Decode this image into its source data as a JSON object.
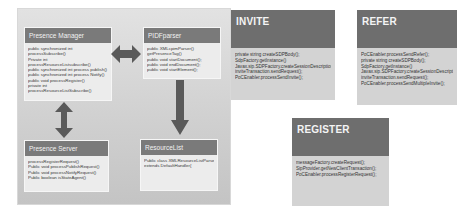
{
  "diagram": {
    "left_panel": {
      "presence_manager": {
        "title": "Presence Manager",
        "lines": [
          "public synchronized int",
          "processSubscribe()",
          "Private int",
          "processResourceListsubscribe()",
          "public synchronized int process publish()",
          "public synchronized int process Notify()",
          "public void processRegister()",
          "private int",
          "processResourceListSubscribe()"
        ]
      },
      "pidf_parser": {
        "title": "PIDFparser",
        "lines": [
          "public XMLcpimParser()",
          "getPresenceTag()",
          "public void startDocument();",
          "public void endDocument();",
          "public void startElement();"
        ]
      },
      "presence_server": {
        "title": "Presence Server",
        "lines": [
          "processRegisterRequest()",
          "Public void processPublishRequest()",
          "Public void processNotifyRequest()",
          "Public boolean isStateAgent()"
        ]
      },
      "resource_list": {
        "title": "ResourceList",
        "lines": [
          "Public class XMLResourceListParser",
          "extends DefaultHandler{"
        ]
      }
    },
    "invite": {
      "title": "INVITE",
      "lines": [
        "private string createSDPBody();",
        "SdpFactory.getInstance()",
        "Javax.sip.SDPFactory.createSessionDescription();",
        "inviteTransaction.sendRequest();",
        "PoCEnabler.processSendInvite();"
      ]
    },
    "refer": {
      "title": "REFER",
      "lines": [
        "PoCEnabler.processSendRefer();",
        "private string createSDPBody();",
        "SdpFactory.getInstance()",
        "Javax.sip.SDPFactory.createSessionDescription();",
        "inviteTransaction.sendRequest();",
        "PoCEnabler.processSendMultipleInvite();"
      ]
    },
    "register": {
      "title": "REGISTER",
      "lines": [
        "messageFactory.createRequest();",
        "SipProvider.getNewClientTransaction();",
        "PoCEnabler.processRegisterRequest();"
      ]
    }
  }
}
